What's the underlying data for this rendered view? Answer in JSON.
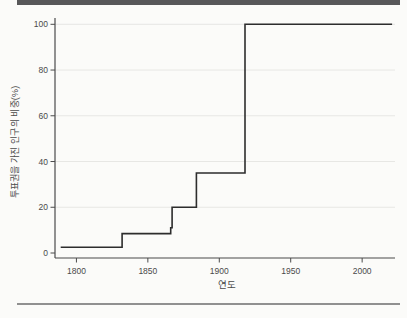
{
  "colors": {
    "background": "#fbfbf9",
    "top_rule": "#58585a",
    "bottom_rule": "#909090",
    "grid": "#e7e7e4",
    "axis": "#4b4b4b",
    "text": "#4a4a4a",
    "line": "#2d2d2d"
  },
  "chart_data": {
    "type": "line",
    "line_style": "step",
    "title": "",
    "xlabel": "연도",
    "ylabel": "투표권을 가진 인구의 비중(%)",
    "x_ticks": [
      1800,
      1850,
      1900,
      1950,
      2000
    ],
    "y_ticks": [
      0,
      20,
      40,
      60,
      80,
      100
    ],
    "xlim": [
      1785,
      2023
    ],
    "ylim": [
      0,
      100
    ],
    "grid": "horizontal",
    "legend": "none",
    "series": [
      {
        "name": "투표권을 가진 인구의 비중(%)",
        "points": [
          [
            1789,
            2.5
          ],
          [
            1831,
            2.5
          ],
          [
            1832,
            8.5
          ],
          [
            1864,
            8.5
          ],
          [
            1866,
            11
          ],
          [
            1867,
            20
          ],
          [
            1883,
            20
          ],
          [
            1884,
            35
          ],
          [
            1917,
            35
          ],
          [
            1918,
            100
          ],
          [
            2021,
            100
          ]
        ]
      }
    ]
  }
}
